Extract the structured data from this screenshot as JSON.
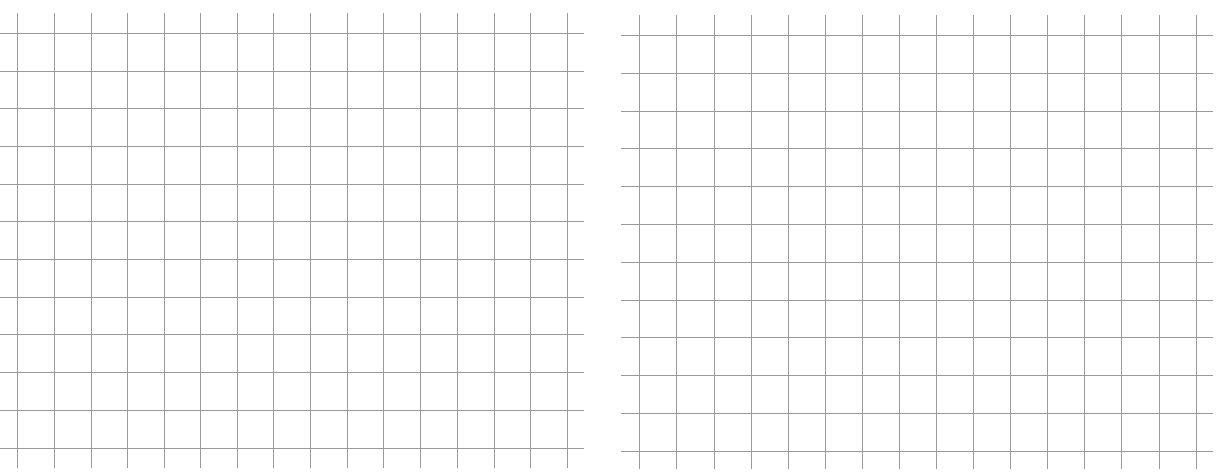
{
  "grids": [
    {
      "name": "left-grid",
      "left": 0,
      "top": 0,
      "x_start": 0,
      "x_end": 584,
      "v_top": 13,
      "v_bottom": 468,
      "verticals": [
        17,
        54,
        91,
        127,
        164,
        200,
        237,
        273,
        310,
        347,
        383,
        420,
        457,
        494,
        530,
        567
      ],
      "horizontals": [
        33,
        71,
        108,
        146,
        184,
        221,
        259,
        297,
        334,
        372,
        410,
        448
      ],
      "line_color": "#9a9a9a"
    },
    {
      "name": "right-grid",
      "left": 0,
      "top": 0,
      "x_start": 621,
      "x_end": 1213,
      "v_top": 15,
      "v_bottom": 469,
      "verticals": [
        639,
        676,
        714,
        751,
        788,
        825,
        862,
        899,
        936,
        973,
        1010,
        1047,
        1084,
        1121,
        1159,
        1196
      ],
      "horizontals": [
        35,
        73,
        111,
        148,
        186,
        224,
        262,
        300,
        337,
        375,
        413,
        451
      ],
      "line_color": "#9a9a9a"
    }
  ]
}
